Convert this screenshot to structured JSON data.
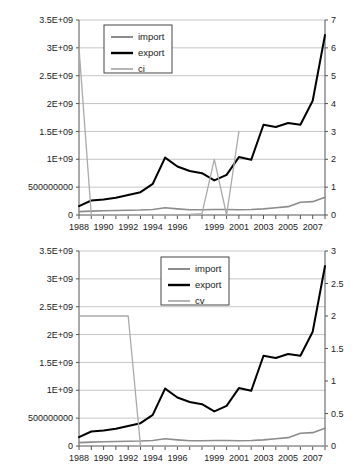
{
  "charts": [
    {
      "id": "top-chart",
      "type": "line",
      "title": "",
      "xlabel": "",
      "ylabel": "",
      "y_left": {
        "ticks": [
          "0",
          "500000000",
          "1E+09",
          "1.5E+09",
          "2E+09",
          "2.5E+09",
          "3E+09",
          "3.5E+09"
        ],
        "values": [
          0,
          500000000,
          1000000000,
          1500000000,
          2000000000,
          2500000000,
          3000000000,
          3500000000
        ],
        "min": 0,
        "max": 3500000000
      },
      "y_right": {
        "ticks": [
          "0",
          "1",
          "2",
          "3",
          "4",
          "5",
          "6",
          "7"
        ],
        "values": [
          0,
          1,
          2,
          3,
          4,
          5,
          6,
          7
        ],
        "min": 0,
        "max": 7
      },
      "x": [
        1988,
        1989,
        1990,
        1991,
        1992,
        1993,
        1994,
        1995,
        1996,
        1997,
        1998,
        1999,
        2000,
        2001,
        2002,
        2003,
        2004,
        2005,
        2006,
        2007,
        2008
      ],
      "x_tick_labels": [
        "1988",
        "",
        "1990",
        "",
        "1992",
        "",
        "1994",
        "",
        "1996",
        "",
        "",
        "1999",
        "",
        "2001",
        "",
        "2003",
        "",
        "2005",
        "",
        "2007",
        ""
      ],
      "grid": true,
      "legend_position": "top-left-inset",
      "series": [
        {
          "name": "import",
          "axis": "left",
          "color": "#8c8c8c",
          "width": 1.6,
          "values": [
            60000000,
            70000000,
            75000000,
            80000000,
            85000000,
            90000000,
            100000000,
            130000000,
            110000000,
            95000000,
            95000000,
            100000000,
            100000000,
            95000000,
            100000000,
            110000000,
            130000000,
            150000000,
            230000000,
            240000000,
            320000000
          ]
        },
        {
          "name": "export",
          "axis": "left",
          "color": "#000000",
          "width": 2.0,
          "values": [
            160000000,
            260000000,
            280000000,
            310000000,
            360000000,
            410000000,
            560000000,
            1030000000,
            870000000,
            790000000,
            750000000,
            620000000,
            720000000,
            1040000000,
            990000000,
            1620000000,
            1580000000,
            1650000000,
            1620000000,
            2050000000,
            3230000000
          ]
        },
        {
          "name": "ci",
          "axis": "right",
          "color": "#aaaaaa",
          "width": 1.3,
          "values": [
            6.0,
            0.0,
            0.0,
            0.0,
            0.0,
            0.0,
            0.0,
            0.0,
            0.0,
            0.02,
            0.05,
            2.0,
            0.0,
            3.0,
            null,
            null,
            null,
            null,
            null,
            null,
            null
          ]
        }
      ]
    },
    {
      "id": "bottom-chart",
      "type": "line",
      "title": "",
      "xlabel": "",
      "ylabel": "",
      "y_left": {
        "ticks": [
          "0",
          "500000000",
          "1E+09",
          "1.5E+09",
          "2E+09",
          "2.5E+09",
          "3E+09",
          "3.5E+09"
        ],
        "values": [
          0,
          500000000,
          1000000000,
          1500000000,
          2000000000,
          2500000000,
          3000000000,
          3500000000
        ],
        "min": 0,
        "max": 3500000000
      },
      "y_right": {
        "ticks": [
          "0",
          "0.5",
          "1",
          "1.5",
          "2",
          "2.5",
          "3"
        ],
        "values": [
          0,
          0.5,
          1,
          1.5,
          2,
          2.5,
          3
        ],
        "min": 0,
        "max": 3
      },
      "x": [
        1988,
        1989,
        1990,
        1991,
        1992,
        1993,
        1994,
        1995,
        1996,
        1997,
        1998,
        1999,
        2000,
        2001,
        2002,
        2003,
        2004,
        2005,
        2006,
        2007,
        2008
      ],
      "x_tick_labels": [
        "1988",
        "",
        "1990",
        "",
        "1992",
        "",
        "1994",
        "",
        "1996",
        "",
        "",
        "1999",
        "",
        "2001",
        "",
        "2003",
        "",
        "2005",
        "",
        "2007",
        ""
      ],
      "grid": true,
      "legend_position": "top-center-inset",
      "series": [
        {
          "name": "import",
          "axis": "left",
          "color": "#8c8c8c",
          "width": 1.6,
          "values": [
            60000000,
            70000000,
            75000000,
            80000000,
            85000000,
            90000000,
            100000000,
            130000000,
            110000000,
            95000000,
            95000000,
            100000000,
            100000000,
            95000000,
            100000000,
            110000000,
            130000000,
            150000000,
            230000000,
            240000000,
            320000000
          ]
        },
        {
          "name": "export",
          "axis": "left",
          "color": "#000000",
          "width": 2.0,
          "values": [
            160000000,
            260000000,
            280000000,
            310000000,
            360000000,
            410000000,
            560000000,
            1030000000,
            870000000,
            790000000,
            750000000,
            620000000,
            720000000,
            1040000000,
            990000000,
            1620000000,
            1580000000,
            1650000000,
            1620000000,
            2050000000,
            3230000000
          ]
        },
        {
          "name": "cv",
          "axis": "right",
          "color": "#aaaaaa",
          "width": 1.3,
          "values": [
            2.0,
            2.0,
            2.0,
            2.0,
            2.0,
            0.0,
            0.0,
            0.0,
            0.0,
            0.0,
            0.0,
            0.0,
            0.0,
            0.0,
            0.0,
            0.0,
            0.0,
            0.0,
            0.0,
            0.0,
            0.0
          ]
        }
      ]
    }
  ]
}
